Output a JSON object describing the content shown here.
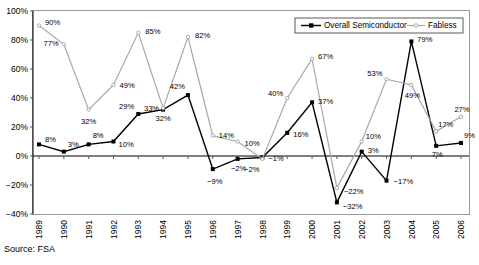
{
  "source_note": "Source: FSA",
  "legend": {
    "position": "top-right-inside",
    "entries": [
      {
        "label": "Overall Semiconductor",
        "color": "#000000",
        "marker": "square"
      },
      {
        "label": "Fabless",
        "color": "#a8a8a8",
        "marker": "dot"
      }
    ]
  },
  "chart_data": {
    "type": "line",
    "title": "",
    "subtitle": "",
    "xlabel": "",
    "ylabel": "",
    "grid": false,
    "ylim": [
      -40,
      100
    ],
    "ytick_labels": [
      "100%",
      "80%",
      "60%",
      "40%",
      "20%",
      "0%",
      "-20%",
      "-40%"
    ],
    "ytick_values": [
      100,
      80,
      60,
      40,
      20,
      0,
      -20,
      -40
    ],
    "categories": [
      "1989",
      "1990",
      "1991",
      "1992",
      "1993",
      "1994",
      "1995",
      "1996",
      "1997",
      "1998",
      "1999",
      "2000",
      "2001",
      "2002",
      "2003",
      "2004",
      "2005",
      "2006"
    ],
    "series": [
      {
        "name": "Overall Semiconductor",
        "color": "#000000",
        "values": [
          8,
          3,
          8,
          10,
          29,
          32,
          42,
          -9,
          -2,
          -1,
          16,
          37,
          -32,
          3,
          -17,
          79,
          7,
          9
        ],
        "labels": [
          "8%",
          "3%",
          "8%",
          "10%",
          "29%",
          "32%",
          "42%",
          "-9%",
          "-2%",
          "-1%",
          "16%",
          "37%",
          "-32%",
          "3%",
          "-17%",
          "79%",
          "7%",
          "9%"
        ]
      },
      {
        "name": "Fabless",
        "color": "#a8a8a8",
        "values": [
          90,
          77,
          32,
          49,
          85,
          33,
          82,
          14,
          10,
          -2,
          40,
          67,
          -22,
          10,
          53,
          49,
          17,
          27
        ],
        "labels": [
          "90%",
          "77%",
          "32%",
          "49%",
          "85%",
          "33%",
          "82%",
          "14%",
          "10%",
          "-2%",
          "40%",
          "67%",
          "-22%",
          "10%",
          "53%",
          "49%",
          "17%",
          "27%"
        ]
      }
    ]
  }
}
